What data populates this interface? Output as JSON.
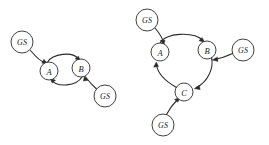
{
  "figure": {
    "background_color": "#ffffff",
    "stroke_color": "#2b2b2b",
    "width": 269,
    "height": 145
  },
  "diagrams": [
    {
      "id": "two-state-cycle",
      "name": "two-node-cycle-diagram",
      "nodes": [
        {
          "id": "L-GS1",
          "label": "GS",
          "kind": "gs",
          "cx": 22,
          "cy": 42,
          "r": 11
        },
        {
          "id": "L-A",
          "label": "A",
          "kind": "state",
          "cx": 49,
          "cy": 71,
          "r": 9
        },
        {
          "id": "L-B",
          "label": "B",
          "kind": "state",
          "cx": 81,
          "cy": 68,
          "r": 9
        },
        {
          "id": "L-GS2",
          "label": "GS",
          "kind": "gs",
          "cx": 105,
          "cy": 96,
          "r": 11
        }
      ],
      "edges": [
        {
          "id": "L-e1",
          "from": "L-GS1",
          "to": "L-A",
          "style": "curved",
          "arrow": "to"
        },
        {
          "id": "L-e2",
          "from": "L-A",
          "to": "L-B",
          "style": "arc-top",
          "arrow": "to"
        },
        {
          "id": "L-e3",
          "from": "L-B",
          "to": "L-A",
          "style": "arc-bottom",
          "arrow": "to"
        },
        {
          "id": "L-e4",
          "from": "L-GS2",
          "to": "L-B",
          "style": "curved",
          "arrow": "to"
        }
      ]
    },
    {
      "id": "three-state-cycle",
      "name": "three-node-cycle-diagram",
      "nodes": [
        {
          "id": "R-GS1",
          "label": "GS",
          "kind": "gs",
          "cx": 147,
          "cy": 20,
          "r": 11
        },
        {
          "id": "R-A",
          "label": "A",
          "kind": "state",
          "cx": 160,
          "cy": 52,
          "r": 9
        },
        {
          "id": "R-B",
          "label": "B",
          "kind": "state",
          "cx": 207,
          "cy": 50,
          "r": 9
        },
        {
          "id": "R-GS2",
          "label": "GS",
          "kind": "gs",
          "cx": 243,
          "cy": 50,
          "r": 11
        },
        {
          "id": "R-C",
          "label": "C",
          "kind": "state",
          "cx": 184,
          "cy": 92,
          "r": 9
        },
        {
          "id": "R-GS3",
          "label": "GS",
          "kind": "gs",
          "cx": 163,
          "cy": 125,
          "r": 11
        }
      ],
      "edges": [
        {
          "id": "R-e1",
          "from": "R-GS1",
          "to": "R-A",
          "style": "curved",
          "arrow": "to"
        },
        {
          "id": "R-e2",
          "from": "R-A",
          "to": "R-B",
          "style": "arc-top",
          "arrow": "to"
        },
        {
          "id": "R-e3",
          "from": "R-B",
          "to": "R-C",
          "style": "arc-right",
          "arrow": "to"
        },
        {
          "id": "R-e4",
          "from": "R-C",
          "to": "R-A",
          "style": "arc-left",
          "arrow": "to"
        },
        {
          "id": "R-e5",
          "from": "R-GS2",
          "to": "R-B",
          "style": "curved",
          "arrow": "to"
        },
        {
          "id": "R-e6",
          "from": "R-GS3",
          "to": "R-C",
          "style": "curved",
          "arrow": "to"
        }
      ]
    }
  ],
  "labels": {
    "gs": "GS",
    "state_a": "A",
    "state_b": "B",
    "state_c": "C"
  }
}
